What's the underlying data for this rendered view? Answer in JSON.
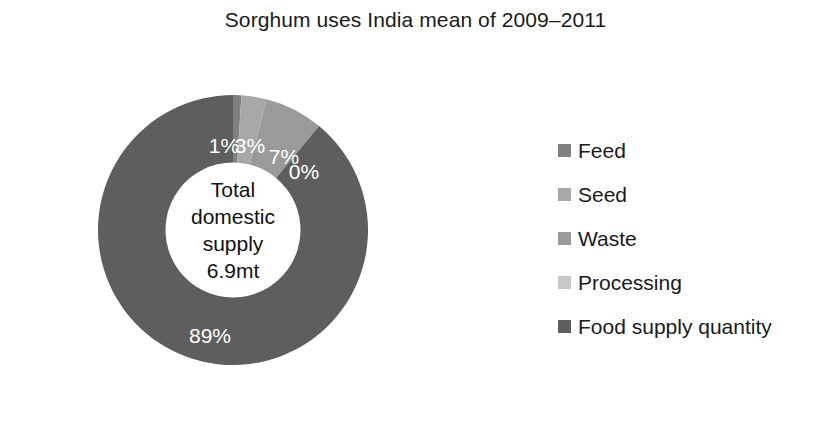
{
  "chart_data": {
    "type": "pie",
    "variant": "donut",
    "title": "Sorghum uses India mean of 2009–2011",
    "categories": [
      "Feed",
      "Seed",
      "Waste",
      "Processing",
      "Food supply quantity"
    ],
    "values": [
      1,
      3,
      7,
      0,
      89
    ],
    "value_labels": [
      "1%",
      "3%",
      "7%",
      "0%",
      "89%"
    ],
    "units": "percent",
    "center_label": {
      "line1": "Total",
      "line2": "domestic",
      "line3": "supply",
      "line4": "6.9mt"
    },
    "colors": [
      "#808080",
      "#a8a8a8",
      "#9a9a9a",
      "#c8c8c8",
      "#5e5e5e"
    ],
    "legend_position": "right",
    "grid": false,
    "xlabel": "",
    "ylabel": "",
    "start_angle_deg": 0,
    "direction": "clockwise",
    "inner_radius_ratio": 0.5
  },
  "legend": {
    "items": [
      {
        "label": "Feed",
        "color": "#808080",
        "value_label": "1%"
      },
      {
        "label": "Seed",
        "color": "#a8a8a8",
        "value_label": "3%"
      },
      {
        "label": "Waste",
        "color": "#9a9a9a",
        "value_label": "7%"
      },
      {
        "label": "Processing",
        "color": "#c8c8c8",
        "value_label": "0%"
      },
      {
        "label": "Food supply quantity",
        "color": "#5e5e5e",
        "value_label": "89%"
      }
    ]
  }
}
